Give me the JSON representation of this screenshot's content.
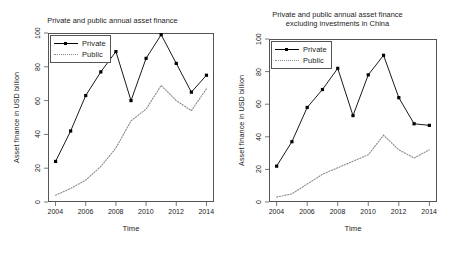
{
  "figure": {
    "width": 450,
    "height": 259,
    "background": "#ffffff",
    "line_color": "#000000",
    "dotted_color": "#8a8a8a",
    "axis_color": "#555555"
  },
  "panels": [
    {
      "id": "left",
      "title": "Private and public annual asset finance",
      "title_lines": [
        "Private and public annual asset finance"
      ],
      "xlabel": "Time",
      "ylabel": "Asset finance in USD billion",
      "legend": {
        "position": "topleft",
        "entries": [
          {
            "label": "Private",
            "style": "solid-with-markers"
          },
          {
            "label": "Public",
            "style": "dotted"
          }
        ]
      },
      "chart_data": {
        "type": "line",
        "title": "Private and public annual asset finance",
        "xlabel": "Time",
        "ylabel": "Asset finance in USD billion",
        "x": [
          2004,
          2005,
          2006,
          2007,
          2008,
          2009,
          2010,
          2011,
          2012,
          2013,
          2014
        ],
        "xlim": [
          2003.5,
          2014.5
        ],
        "ylim": [
          0,
          100
        ],
        "xticks": [
          2004,
          2006,
          2008,
          2010,
          2012,
          2014
        ],
        "yticks": [
          0,
          20,
          40,
          60,
          80,
          100
        ],
        "grid": false,
        "legend_position": "topleft",
        "series": [
          {
            "name": "Private",
            "values": [
              24,
              42,
              63,
              77,
              89,
              60,
              85,
              99,
              82,
              65,
              75
            ]
          },
          {
            "name": "Public",
            "values": [
              4,
              8,
              13,
              21,
              32,
              48,
              55,
              69,
              60,
              54,
              67
            ]
          }
        ]
      }
    },
    {
      "id": "right",
      "title": "Private and public annual asset finance excluding investments in China",
      "title_lines": [
        "Private and public annual asset finance",
        "excluding investments in China"
      ],
      "xlabel": "Time",
      "ylabel": "Asset finance in USD billion",
      "legend": {
        "position": "topleft",
        "entries": [
          {
            "label": "Private",
            "style": "solid-with-markers"
          },
          {
            "label": "Public",
            "style": "dotted"
          }
        ]
      },
      "chart_data": {
        "type": "line",
        "title": "Private and public annual asset finance excluding investments in China",
        "xlabel": "Time",
        "ylabel": "Asset finance in USD billion",
        "x": [
          2004,
          2005,
          2006,
          2007,
          2008,
          2009,
          2010,
          2011,
          2012,
          2013,
          2014
        ],
        "xlim": [
          2003.5,
          2014.5
        ],
        "ylim": [
          0,
          100
        ],
        "xticks": [
          2004,
          2006,
          2008,
          2010,
          2012,
          2014
        ],
        "yticks": [
          0,
          20,
          40,
          60,
          80,
          100
        ],
        "grid": false,
        "legend_position": "topleft",
        "series": [
          {
            "name": "Private",
            "values": [
              22,
              37,
              58,
              69,
              82,
              53,
              78,
              90,
              64,
              48,
              47
            ]
          },
          {
            "name": "Public",
            "values": [
              3,
              5,
              11,
              17,
              21,
              25,
              29,
              41,
              32,
              27,
              32
            ]
          }
        ]
      }
    }
  ]
}
